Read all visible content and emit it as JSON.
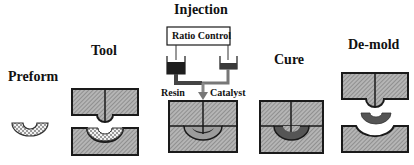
{
  "diagram": {
    "type": "process-flow",
    "stages": [
      {
        "id": "preform",
        "label": "Preform"
      },
      {
        "id": "tool",
        "label": "Tool"
      },
      {
        "id": "injection",
        "label": "Injection"
      },
      {
        "id": "cure",
        "label": "Cure"
      },
      {
        "id": "demold",
        "label": "De-mold"
      }
    ],
    "injection_details": {
      "controller_label": "Ratio Control",
      "inputs": [
        {
          "id": "resin",
          "label": "Resin"
        },
        {
          "id": "catalyst",
          "label": "Catalyst"
        }
      ]
    },
    "colors": {
      "mold_fill": "#a9a9a9",
      "mold_outline": "#1a1a1a",
      "resin_dark": "#2a2a2a",
      "cured_part": "#555555",
      "preform_fill": "#d8d8d8"
    }
  }
}
